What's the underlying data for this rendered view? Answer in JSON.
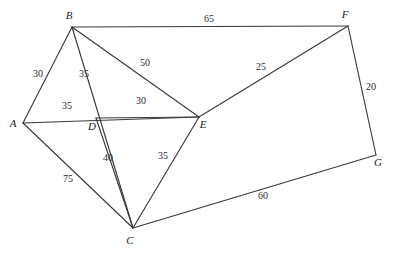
{
  "figure": {
    "kind": "weighted-undirected-graph",
    "background_color": "#ffffff",
    "edge_color": "#3a3a3f",
    "label_color": "#1c1c20",
    "weight_color": "#2a2a30",
    "width": 397,
    "height": 254
  },
  "chart_data": {
    "type": "diagram",
    "title": "",
    "xlabel": "",
    "ylabel": "",
    "graph_type": "weighted undirected graph",
    "node_labels": [
      "A",
      "B",
      "C",
      "D",
      "E",
      "F",
      "G"
    ],
    "edge_list": [
      [
        "A",
        "B",
        30
      ],
      [
        "A",
        "D",
        35
      ],
      [
        "A",
        "C",
        75
      ],
      [
        "B",
        "D",
        35
      ],
      [
        "B",
        "E",
        50
      ],
      [
        "B",
        "F",
        65
      ],
      [
        "D",
        "E",
        30
      ],
      [
        "D",
        "C",
        40
      ],
      [
        "E",
        "C",
        35
      ],
      [
        "E",
        "F",
        25
      ],
      [
        "F",
        "G",
        20
      ],
      [
        "C",
        "G",
        60
      ]
    ],
    "weights": [
      30,
      35,
      75,
      35,
      50,
      65,
      30,
      40,
      35,
      25,
      20,
      60
    ]
  },
  "nodes": [
    {
      "id": "A",
      "label": "A",
      "x": 23,
      "y": 123,
      "label_x": 13,
      "label_y": 127
    },
    {
      "id": "B",
      "label": "B",
      "x": 72,
      "y": 27,
      "label_x": 69,
      "label_y": 19
    },
    {
      "id": "C",
      "label": "C",
      "x": 133,
      "y": 228,
      "label_x": 130,
      "label_y": 244
    },
    {
      "id": "D",
      "label": "D",
      "x": 96,
      "y": 118,
      "label_x": 92,
      "label_y": 130
    },
    {
      "id": "E",
      "label": "E",
      "x": 199,
      "y": 117,
      "label_x": 203,
      "label_y": 128
    },
    {
      "id": "F",
      "label": "F",
      "x": 348,
      "y": 26,
      "label_x": 345,
      "label_y": 18
    },
    {
      "id": "G",
      "label": "G",
      "x": 376,
      "y": 155,
      "label_x": 378,
      "label_y": 166
    }
  ],
  "edges": [
    {
      "id": "A-B",
      "from": "A",
      "to": "B",
      "x1": 23,
      "y1": 123,
      "x2": 72,
      "y2": 27,
      "weight": "30",
      "wx": 38,
      "wy": 77
    },
    {
      "id": "A-E",
      "from": "A",
      "to": "E",
      "x1": 23,
      "y1": 123,
      "x2": 199,
      "y2": 117,
      "weight": "35",
      "wx": 67,
      "wy": 109
    },
    {
      "id": "A-C",
      "from": "A",
      "to": "C",
      "x1": 23,
      "y1": 123,
      "x2": 133,
      "y2": 228,
      "weight": "75",
      "wx": 68,
      "wy": 182
    },
    {
      "id": "B-C",
      "from": "B",
      "to": "C",
      "x1": 72,
      "y1": 27,
      "x2": 133,
      "y2": 228,
      "weight": "35",
      "wx": 84,
      "wy": 77
    },
    {
      "id": "B-E",
      "from": "B",
      "to": "E",
      "x1": 72,
      "y1": 27,
      "x2": 199,
      "y2": 117,
      "weight": "50",
      "wx": 145,
      "wy": 66
    },
    {
      "id": "B-F",
      "from": "B",
      "to": "F",
      "x1": 72,
      "y1": 27,
      "x2": 348,
      "y2": 26,
      "weight": "65",
      "wx": 209,
      "wy": 22
    },
    {
      "id": "D-E",
      "from": "D",
      "to": "E",
      "x1": 96,
      "y1": 118,
      "x2": 199,
      "y2": 117,
      "weight": "30",
      "wx": 141,
      "wy": 104
    },
    {
      "id": "D-C",
      "from": "D",
      "to": "C",
      "x1": 96,
      "y1": 118,
      "x2": 133,
      "y2": 228,
      "weight": "40",
      "wx": 108,
      "wy": 161
    },
    {
      "id": "E-C",
      "from": "E",
      "to": "C",
      "x1": 199,
      "y1": 117,
      "x2": 133,
      "y2": 228,
      "weight": "35",
      "wx": 163,
      "wy": 159
    },
    {
      "id": "E-F",
      "from": "E",
      "to": "F",
      "x1": 199,
      "y1": 117,
      "x2": 348,
      "y2": 26,
      "weight": "25",
      "wx": 261,
      "wy": 70
    },
    {
      "id": "F-G",
      "from": "F",
      "to": "G",
      "x1": 348,
      "y1": 26,
      "x2": 376,
      "y2": 155,
      "weight": "20",
      "wx": 371,
      "wy": 90
    },
    {
      "id": "C-G",
      "from": "C",
      "to": "G",
      "x1": 133,
      "y1": 228,
      "x2": 376,
      "y2": 155,
      "weight": "60",
      "wx": 263,
      "wy": 199
    }
  ]
}
